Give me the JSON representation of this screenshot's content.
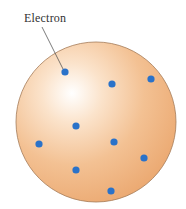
{
  "diagram": {
    "label": "Electron",
    "sphere": {
      "cx": 96,
      "cy": 122,
      "r": 80,
      "fill": "#f0b47c",
      "highlight": "#ffffff",
      "stroke": "#a57b58"
    },
    "electron_color": "#2a72c9",
    "electrons": [
      {
        "x": 65,
        "y": 72
      },
      {
        "x": 112,
        "y": 84
      },
      {
        "x": 151,
        "y": 79
      },
      {
        "x": 76,
        "y": 126
      },
      {
        "x": 39,
        "y": 144
      },
      {
        "x": 114,
        "y": 142
      },
      {
        "x": 144,
        "y": 158
      },
      {
        "x": 76,
        "y": 170
      },
      {
        "x": 111,
        "y": 191
      }
    ],
    "leader_line": {
      "x1": 42,
      "y1": 27,
      "x2": 63,
      "y2": 69
    }
  }
}
